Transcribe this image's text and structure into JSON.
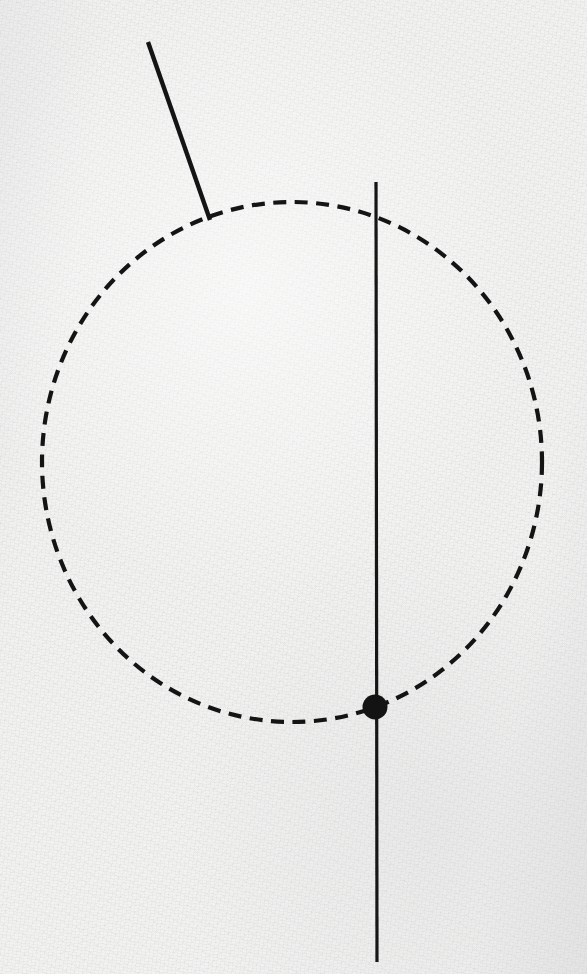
{
  "canvas": {
    "width": 587,
    "height": 974,
    "background_color": "#f2f2f0",
    "medium": "scanned paper with visible grain",
    "ink_color": "#1a1a1a"
  },
  "figure": {
    "title": "Geometric construction: circle with vertical chord, tangent-like segment and marked point",
    "elements": [
      {
        "name": "dashed-circle",
        "type": "ellipse",
        "stroke_color": "#141414",
        "stroke_width": 4.2,
        "dash_length": 13,
        "gap_length": 8.5,
        "center_x": 292,
        "center_y": 462,
        "radius_x": 250,
        "radius_y": 260,
        "bounds": {
          "left": 42,
          "right": 542,
          "top": 202,
          "bottom": 722
        }
      },
      {
        "name": "vertical-line",
        "type": "line",
        "stroke_color": "#161616",
        "stroke_width": 3.2,
        "x1": 376,
        "y1": 182,
        "x2": 377,
        "y2": 962
      },
      {
        "name": "slanted-line",
        "type": "line",
        "stroke_color": "#141414",
        "stroke_width": 4.4,
        "x1": 148,
        "y1": 42,
        "x2": 210,
        "y2": 220
      },
      {
        "name": "marked-point",
        "type": "dot",
        "fill_color": "#131313",
        "center_x": 375,
        "center_y": 707,
        "radius": 12.5
      }
    ]
  },
  "chart_data": {
    "type": "scatter",
    "title": "",
    "xlabel": "",
    "ylabel": "",
    "grid": false,
    "legend": null,
    "xlim": [
      0,
      587
    ],
    "ylim": [
      974,
      0
    ],
    "annotations": [
      "dashed circle centered near (292, 462) with radii 250 x 260",
      "solid vertical line from (376, 182) to (377, 962)",
      "solid slanted segment from (148, 42) to (210, 220) meeting the circle",
      "filled dot at (375, 707) where the vertical line meets the lower arc"
    ],
    "points": [
      {
        "label": "marked-point",
        "x": 375,
        "y": 707
      }
    ],
    "series": [
      {
        "name": "dashed-circle",
        "style": "dashed",
        "x": [
          292
        ],
        "y": [
          462
        ],
        "radius_x": 250,
        "radius_y": 260
      },
      {
        "name": "vertical-line",
        "style": "solid",
        "x": [
          376,
          377
        ],
        "y": [
          182,
          962
        ]
      },
      {
        "name": "slanted-line",
        "style": "solid",
        "x": [
          148,
          210
        ],
        "y": [
          42,
          220
        ]
      }
    ]
  }
}
